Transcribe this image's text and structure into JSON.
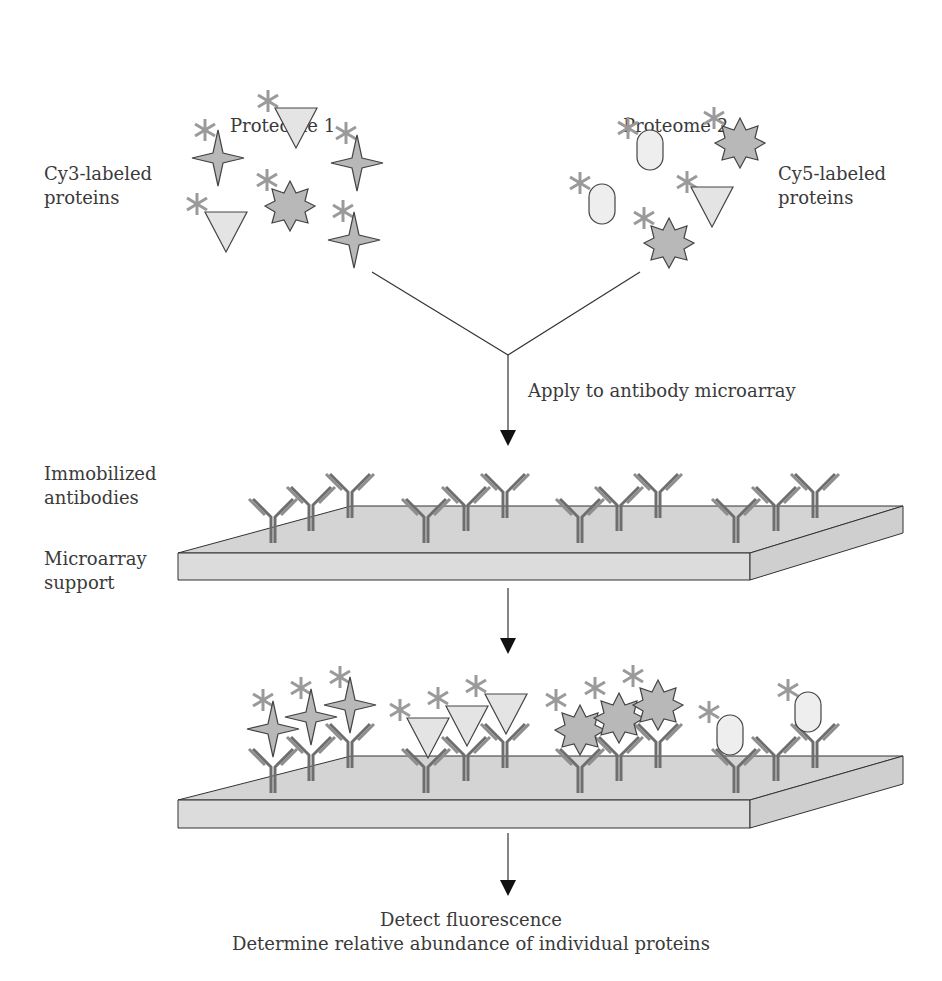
{
  "labels": {
    "proteome1": "Proteome 1",
    "proteome2": "Proteome 2",
    "cy3_line1": "Cy3-labeled",
    "cy3_line2": "proteins",
    "cy5_line1": "Cy5-labeled",
    "cy5_line2": "proteins",
    "apply": "Apply to antibody microarray",
    "immobilized_line1": "Immobilized",
    "immobilized_line2": "antibodies",
    "support_line1": "Microarray",
    "support_line2": "support",
    "detect_line1": "Detect fluorescence",
    "detect_line2": "Determine relative abundance of individual proteins"
  },
  "colors": {
    "label_star": "#9a9a9a",
    "protein_fill": "#b8b8b8",
    "triangle_fill": "#e4e4e4",
    "oval_fill": "#eeeeee",
    "slide_top": "#d4d4d4",
    "slide_side": "#dcdcdc",
    "antibody_dark": "#6e6e6e",
    "antibody_light": "#8e8e8e"
  }
}
